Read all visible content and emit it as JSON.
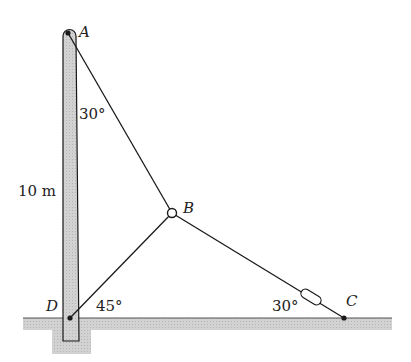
{
  "diagram": {
    "type": "statics-guy-wire-pole",
    "points": {
      "A": {
        "label": "A"
      },
      "B": {
        "label": "B"
      },
      "C": {
        "label": "C"
      },
      "D": {
        "label": "D"
      }
    },
    "dimensions": {
      "pole_height": "10 m"
    },
    "angles": {
      "at_A": "30°",
      "at_D": "45°",
      "at_C": "30°"
    },
    "elements": [
      "pole",
      "cable AB",
      "cable BD",
      "cable BC with turnbuckle",
      "ground",
      "foundation"
    ],
    "colors": {
      "line": "#1a1a1a",
      "pole_fill": "#d4d4d4",
      "ground_fill": "#c8c8c8"
    }
  }
}
